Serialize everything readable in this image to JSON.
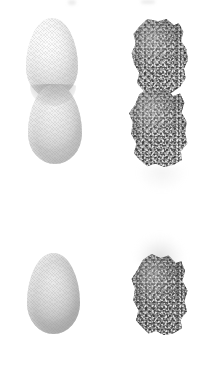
{
  "figure": {
    "background_color": "#ffffff",
    "width": 219,
    "height": 389,
    "layout": "2 rows x 2 columns",
    "caption": "",
    "title": ""
  },
  "rows": [
    {
      "id": "row-top",
      "label": "",
      "panels": [
        {
          "id": "panel-top-left",
          "column": "left",
          "label": "",
          "surface": "smooth",
          "object_count": 2,
          "arrangement": "vertically stacked, overlapping",
          "objects": [
            {
              "id": "ovoid-pale",
              "shape": "ovoid",
              "shape_label": "egg",
              "surface": "smooth-crosshatch",
              "fill_color": "#f4f4f4",
              "shade_color": "#dadada",
              "highlight_color": "#fdfdfd",
              "tone": "very pale"
            },
            {
              "id": "ovoid-mid",
              "shape": "ovoid",
              "shape_label": "egg",
              "surface": "smooth-crosshatch",
              "fill_color": "#e4e4e4",
              "shade_color": "#c8c8c8",
              "highlight_color": "#f2f2f2",
              "tone": "light grey"
            }
          ]
        },
        {
          "id": "panel-top-right",
          "column": "right",
          "label": "",
          "surface": "granular",
          "object_count": 2,
          "arrangement": "vertically stacked, touching",
          "objects": [
            {
              "id": "rock-upper",
              "shape": "irregular-aggregate",
              "shape_label": "rock",
              "surface": "speckled-granular",
              "fill_color": "#a2a2a2",
              "speckle_dark": "#3c3c3c",
              "speckle_light": "#ededed",
              "tone": "mid grey"
            },
            {
              "id": "rock-lower",
              "shape": "irregular-aggregate",
              "shape_label": "rock",
              "surface": "speckled-granular",
              "fill_color": "#a2a2a2",
              "speckle_dark": "#3c3c3c",
              "speckle_light": "#ededed",
              "tone": "mid grey"
            }
          ]
        }
      ]
    },
    {
      "id": "row-bottom",
      "label": "",
      "panels": [
        {
          "id": "panel-bottom-left",
          "column": "left",
          "label": "",
          "surface": "smooth",
          "object_count": 1,
          "arrangement": "single",
          "objects": [
            {
              "id": "ovoid-grey",
              "shape": "ovoid",
              "shape_label": "egg",
              "surface": "smooth-crosshatch",
              "fill_color": "#dcdcdc",
              "shade_color": "#b9b9b9",
              "highlight_color": "#eaeaea",
              "tone": "grey"
            }
          ]
        },
        {
          "id": "panel-bottom-right",
          "column": "right",
          "label": "",
          "surface": "granular",
          "object_count": 1,
          "arrangement": "single with light scatter above",
          "objects": [
            {
              "id": "rock-dark",
              "shape": "irregular-aggregate",
              "shape_label": "rock",
              "surface": "speckled-granular",
              "fill_color": "#8e8e8e",
              "speckle_dark": "#2d2d2d",
              "speckle_light": "#e8e8e8",
              "tone": "dark grey"
            }
          ]
        }
      ]
    }
  ],
  "artifacts": {
    "top_edge_left": "faint cropped smudge",
    "top_edge_right": "faint cropped smudge",
    "row_gap": "faint haze"
  }
}
